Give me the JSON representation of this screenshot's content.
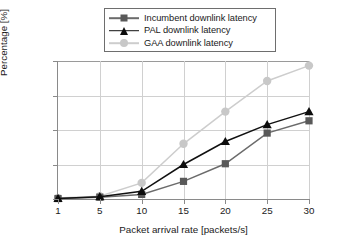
{
  "chart_data": {
    "type": "line",
    "title": "",
    "xlabel": "Packet arrival rate [packets/s]",
    "ylabel": "Percentage [%]",
    "categories": [
      1,
      5,
      10,
      15,
      20,
      25,
      30
    ],
    "xtick_labels": [
      "1",
      "5",
      "10",
      "15",
      "20",
      "25",
      "30"
    ],
    "ytick_labels": [
      "0",
      "2250",
      "4500",
      "6750",
      "9000"
    ],
    "yticks": [
      0,
      2250,
      4500,
      6750,
      9000
    ],
    "ylim": [
      0,
      9000
    ],
    "grid": true,
    "legend_position": "top-center",
    "series": [
      {
        "name": "Incumbent downlink latency",
        "marker": "square",
        "color": "#595959",
        "line_color": "#6b6b6b",
        "values": [
          30,
          120,
          300,
          1150,
          2300,
          4300,
          5100
        ]
      },
      {
        "name": "PAL downlink latency",
        "marker": "triangle",
        "color": "#0d0d0d",
        "line_color": "#111111",
        "values": [
          40,
          150,
          500,
          2250,
          3750,
          4850,
          5700
        ]
      },
      {
        "name": "GAA downlink latency",
        "marker": "circle",
        "color": "#c8c8c8",
        "line_color": "#cdcdcd",
        "values": [
          60,
          180,
          1050,
          3600,
          5700,
          7700,
          8700
        ]
      }
    ]
  },
  "legend": {
    "items": [
      {
        "label": "Incumbent downlink latency"
      },
      {
        "label": "PAL downlink latency"
      },
      {
        "label": "GAA downlink latency"
      }
    ]
  },
  "axes": {
    "x_title": "Packet arrival rate [packets/s]",
    "y_title": "Percentage [%]"
  }
}
